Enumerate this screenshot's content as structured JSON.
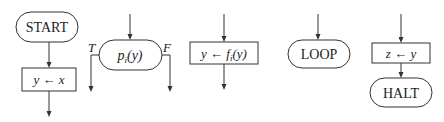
{
  "diagram": {
    "type": "flowchart-statement-legend",
    "colors": {
      "stroke": "#333333",
      "text": "#222222",
      "background": "#ffffff"
    },
    "elements": [
      {
        "id": "start",
        "shape": "terminal",
        "label": "START"
      },
      {
        "id": "assign-y-x",
        "shape": "process",
        "label": "y ← x"
      },
      {
        "id": "test-p",
        "shape": "decision",
        "label": "pi(y)",
        "label_main": "p",
        "label_sub": "i",
        "label_arg": "(y)",
        "true_label": "T",
        "false_label": "F"
      },
      {
        "id": "assign-y-f",
        "shape": "process",
        "label": "y ← fi(y)",
        "label_pre": "y ← f",
        "label_sub": "i",
        "label_arg": "(y)"
      },
      {
        "id": "loop",
        "shape": "terminal",
        "label": "LOOP"
      },
      {
        "id": "assign-z-y",
        "shape": "process",
        "label": "z ← y"
      },
      {
        "id": "halt",
        "shape": "terminal",
        "label": "HALT"
      }
    ],
    "connections": [
      {
        "from": "start",
        "to": "assign-y-x"
      },
      {
        "from": "assign-y-x",
        "to": "exit"
      },
      {
        "from": "entry",
        "to": "test-p"
      },
      {
        "from": "test-p",
        "to": "exit-true",
        "label": "T"
      },
      {
        "from": "test-p",
        "to": "exit-false",
        "label": "F"
      },
      {
        "from": "entry",
        "to": "assign-y-f"
      },
      {
        "from": "assign-y-f",
        "to": "exit"
      },
      {
        "from": "entry",
        "to": "loop"
      },
      {
        "from": "entry",
        "to": "assign-z-y"
      },
      {
        "from": "assign-z-y",
        "to": "halt"
      }
    ]
  }
}
